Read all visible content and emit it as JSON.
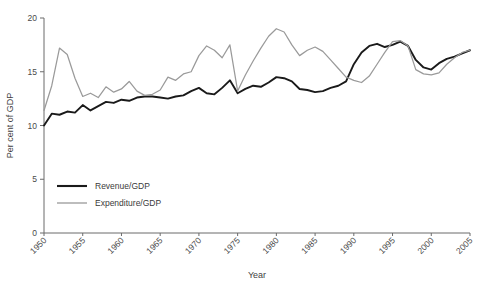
{
  "chart_data": {
    "type": "line",
    "title": "",
    "xlabel": "Year",
    "ylabel": "Per cent of GDP",
    "xlim": [
      1950,
      2005
    ],
    "ylim": [
      0,
      20
    ],
    "yticks": [
      0,
      5,
      10,
      15,
      20
    ],
    "xticks": [
      1950,
      1955,
      1960,
      1965,
      1970,
      1975,
      1980,
      1985,
      1990,
      1995,
      2000,
      2005
    ],
    "grid": false,
    "legend_position": "lower left",
    "x": [
      1950,
      1951,
      1952,
      1953,
      1954,
      1955,
      1956,
      1957,
      1958,
      1959,
      1960,
      1961,
      1962,
      1963,
      1964,
      1965,
      1966,
      1967,
      1968,
      1969,
      1970,
      1971,
      1972,
      1973,
      1974,
      1975,
      1976,
      1977,
      1978,
      1979,
      1980,
      1981,
      1982,
      1983,
      1984,
      1985,
      1986,
      1987,
      1988,
      1989,
      1990,
      1991,
      1992,
      1993,
      1994,
      1995,
      1996,
      1997,
      1998,
      1999,
      2000,
      2001,
      2002,
      2003,
      2004,
      2005
    ],
    "series": [
      {
        "name": "Revenue/GDP",
        "color": "#1a1a1a",
        "values": [
          10.0,
          11.1,
          11.0,
          11.3,
          11.2,
          11.9,
          11.4,
          11.8,
          12.2,
          12.1,
          12.4,
          12.3,
          12.6,
          12.7,
          12.7,
          12.6,
          12.5,
          12.7,
          12.8,
          13.2,
          13.5,
          13.0,
          12.9,
          13.5,
          14.2,
          13.0,
          13.4,
          13.7,
          13.6,
          14.0,
          14.5,
          14.4,
          14.1,
          13.4,
          13.3,
          13.1,
          13.2,
          13.5,
          13.7,
          14.1,
          15.7,
          16.8,
          17.4,
          17.6,
          17.3,
          17.5,
          17.8,
          17.4,
          16.1,
          15.4,
          15.2,
          15.8,
          16.2,
          16.4,
          16.7,
          17.0
        ]
      },
      {
        "name": "Expenditure/GDP",
        "color": "#9a9a9a",
        "values": [
          11.4,
          13.7,
          17.2,
          16.6,
          14.4,
          12.7,
          13.0,
          12.6,
          13.6,
          13.1,
          13.4,
          14.1,
          13.2,
          12.8,
          12.9,
          13.3,
          14.5,
          14.2,
          14.8,
          15.0,
          16.5,
          17.4,
          17.0,
          16.3,
          17.5,
          13.2,
          14.7,
          16.0,
          17.2,
          18.3,
          19.0,
          18.7,
          17.5,
          16.5,
          17.0,
          17.3,
          16.9,
          16.1,
          15.3,
          14.5,
          14.2,
          14.0,
          14.6,
          15.7,
          16.8,
          17.8,
          17.9,
          17.4,
          15.2,
          14.8,
          14.7,
          14.9,
          15.7,
          16.3,
          16.8,
          17.0
        ]
      }
    ]
  },
  "legend": {
    "items": [
      {
        "label": "Revenue/GDP"
      },
      {
        "label": "Expenditure/GDP"
      }
    ]
  },
  "axes": {
    "y_title": "Per cent of GDP",
    "x_title": "Year",
    "y_tick_labels": [
      "0",
      "5",
      "10",
      "15",
      "20"
    ],
    "x_tick_labels": [
      "1950",
      "1955",
      "1960",
      "1965",
      "1970",
      "1975",
      "1980",
      "1985",
      "1990",
      "1995",
      "2000",
      "2005"
    ]
  }
}
